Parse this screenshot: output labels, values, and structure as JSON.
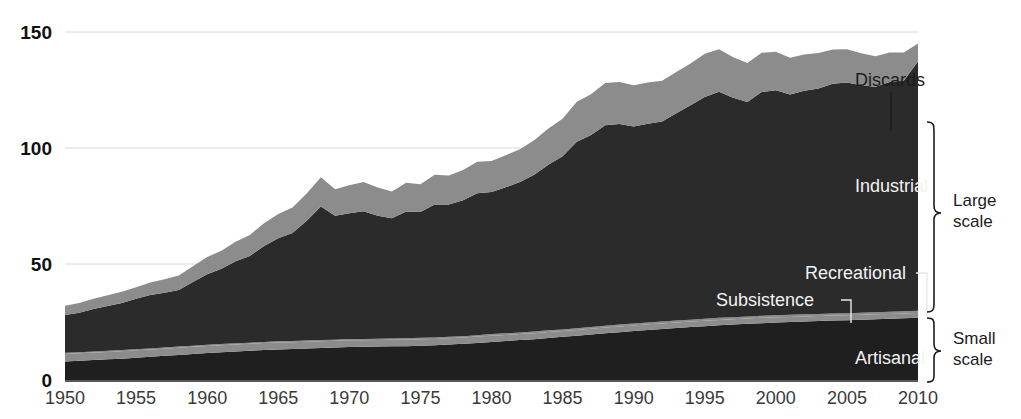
{
  "chart_data": {
    "type": "area",
    "stacked": true,
    "title": "",
    "xlabel": "",
    "ylabel": "",
    "xlim": [
      1950,
      2010
    ],
    "ylim": [
      0,
      150
    ],
    "yticks": [
      0,
      50,
      100,
      150
    ],
    "xticks": [
      1950,
      1955,
      1960,
      1965,
      1970,
      1975,
      1980,
      1985,
      1990,
      1995,
      2000,
      2005,
      2010
    ],
    "grid": "horizontal",
    "legend_position": "in-plot annotations",
    "x": [
      1950,
      1951,
      1952,
      1953,
      1954,
      1955,
      1956,
      1957,
      1958,
      1959,
      1960,
      1961,
      1962,
      1963,
      1964,
      1965,
      1966,
      1967,
      1968,
      1969,
      1970,
      1971,
      1972,
      1973,
      1974,
      1975,
      1976,
      1977,
      1978,
      1979,
      1980,
      1981,
      1982,
      1983,
      1984,
      1985,
      1986,
      1987,
      1988,
      1989,
      1990,
      1991,
      1992,
      1993,
      1994,
      1995,
      1996,
      1997,
      1998,
      1999,
      2000,
      2001,
      2002,
      2003,
      2004,
      2005,
      2006,
      2007,
      2008,
      2009,
      2010
    ],
    "series": [
      {
        "name": "Artisanal",
        "color": "#1f1f1f",
        "scale_group": "Small scale",
        "values": [
          8.0,
          8.3,
          8.6,
          8.9,
          9.2,
          9.6,
          10.0,
          10.4,
          10.8,
          11.2,
          11.6,
          12.0,
          12.3,
          12.6,
          12.9,
          13.2,
          13.4,
          13.6,
          13.8,
          14.0,
          14.2,
          14.3,
          14.4,
          14.5,
          14.6,
          14.8,
          15.0,
          15.3,
          15.6,
          16.0,
          16.4,
          16.8,
          17.2,
          17.6,
          18.1,
          18.6,
          19.1,
          19.6,
          20.1,
          20.6,
          21.1,
          21.6,
          22.0,
          22.4,
          22.8,
          23.2,
          23.6,
          23.9,
          24.2,
          24.5,
          24.8,
          25.0,
          25.2,
          25.4,
          25.6,
          25.8,
          26.0,
          26.2,
          26.4,
          26.6,
          26.8
        ]
      },
      {
        "name": "Subsistence",
        "color": "#8c8c8c",
        "scale_group": "Small scale",
        "values": [
          3.2,
          3.2,
          3.2,
          3.2,
          3.2,
          3.2,
          3.1,
          3.1,
          3.1,
          3.1,
          3.1,
          3.0,
          3.0,
          3.0,
          3.0,
          3.0,
          2.9,
          2.9,
          2.9,
          2.9,
          2.9,
          2.8,
          2.8,
          2.8,
          2.8,
          2.8,
          2.7,
          2.7,
          2.7,
          2.7,
          2.7,
          2.6,
          2.6,
          2.6,
          2.6,
          2.5,
          2.5,
          2.5,
          2.5,
          2.5,
          2.4,
          2.4,
          2.4,
          2.4,
          2.4,
          2.3,
          2.3,
          2.3,
          2.3,
          2.3,
          2.2,
          2.2,
          2.2,
          2.2,
          2.2,
          2.1,
          2.1,
          2.1,
          2.1,
          2.1,
          2.1
        ]
      },
      {
        "name": "Recreational",
        "color": "#8c8c8c",
        "scale_group": "Small scale",
        "values": [
          0.5,
          0.5,
          0.5,
          0.5,
          0.5,
          0.5,
          0.5,
          0.5,
          0.5,
          0.5,
          0.5,
          0.5,
          0.5,
          0.5,
          0.5,
          0.5,
          0.5,
          0.5,
          0.5,
          0.5,
          0.6,
          0.6,
          0.6,
          0.6,
          0.6,
          0.6,
          0.6,
          0.6,
          0.6,
          0.6,
          0.7,
          0.7,
          0.7,
          0.7,
          0.7,
          0.7,
          0.7,
          0.7,
          0.8,
          0.8,
          0.8,
          0.8,
          0.8,
          0.8,
          0.8,
          0.9,
          0.9,
          0.9,
          0.9,
          0.9,
          0.9,
          0.9,
          0.9,
          0.9,
          0.9,
          0.9,
          0.9,
          0.9,
          0.9,
          0.9,
          0.9
        ]
      },
      {
        "name": "Industrial",
        "color": "#2b2b2b",
        "scale_group": "Large scale",
        "values": [
          16.3,
          17.0,
          18.3,
          19.3,
          20.3,
          21.7,
          23.0,
          23.6,
          24.4,
          27.4,
          30.4,
          32.4,
          35.4,
          37.4,
          41.4,
          44.4,
          46.6,
          51.6,
          57.6,
          53.4,
          54.2,
          55.0,
          53.0,
          51.8,
          54.6,
          54.2,
          57.4,
          57.0,
          58.6,
          61.2,
          61.2,
          63.0,
          64.8,
          67.6,
          71.4,
          74.6,
          80.4,
          82.8,
          86.4,
          86.4,
          85.0,
          85.6,
          86.2,
          89.4,
          92.4,
          95.6,
          97.4,
          94.6,
          92.4,
          96.4,
          97.0,
          95.0,
          96.4,
          97.2,
          99.0,
          99.4,
          98.0,
          97.2,
          99.0,
          99.4,
          107.5
        ]
      },
      {
        "name": "Discards",
        "color": "#8c8c8c",
        "scale_group": "Large scale",
        "values": [
          4.0,
          4.2,
          4.4,
          4.6,
          4.8,
          5.0,
          5.4,
          5.8,
          6.2,
          6.8,
          7.4,
          7.8,
          8.4,
          9.0,
          9.8,
          10.4,
          11.0,
          11.8,
          12.6,
          11.4,
          12.0,
          12.6,
          12.2,
          11.6,
          12.4,
          12.0,
          12.8,
          12.6,
          13.0,
          13.6,
          13.4,
          13.8,
          14.2,
          14.8,
          15.6,
          16.2,
          17.2,
          17.6,
          18.2,
          18.2,
          17.8,
          17.8,
          17.6,
          17.8,
          18.0,
          18.6,
          18.4,
          17.4,
          16.8,
          17.0,
          16.6,
          15.8,
          15.6,
          15.2,
          14.8,
          14.4,
          13.8,
          13.2,
          12.8,
          12.2,
          7.7
        ]
      }
    ],
    "annotations": [
      {
        "name": "Discards",
        "text": "Discards",
        "style": "dark",
        "x": 2005,
        "y": 134
      },
      {
        "name": "Industrial",
        "text": "Industrial",
        "style": "light",
        "x": 2003,
        "y": 81
      },
      {
        "name": "Recreational",
        "text": "Recreational",
        "style": "light",
        "x": 1999,
        "y": 47
      },
      {
        "name": "Subsistence",
        "text": "Subsistence",
        "style": "light",
        "x": 1993,
        "y": 40
      },
      {
        "name": "Artisanal",
        "text": "Artisanal",
        "style": "light",
        "x": 2004,
        "y": 9
      }
    ],
    "brackets": [
      {
        "name": "Large scale",
        "label_line1": "Large",
        "label_line2": "scale"
      },
      {
        "name": "Small scale",
        "label_line1": "Small",
        "label_line2": "scale"
      }
    ]
  },
  "axis": {
    "y_labels": [
      "150",
      "100",
      "50",
      "0"
    ],
    "x_labels": [
      "1950",
      "1955",
      "1960",
      "1965",
      "1970",
      "1975",
      "1980",
      "1985",
      "1990",
      "1995",
      "2000",
      "2005",
      "2010"
    ]
  },
  "colors": {
    "dark": "#1f1f1f",
    "industrial": "#2b2b2b",
    "gray": "#8c8c8c",
    "grid": "#d8d8d8",
    "axis": "#222222",
    "text_dark": "#1c1c1c",
    "text_light": "#f2f2f2",
    "background": "#ffffff"
  }
}
